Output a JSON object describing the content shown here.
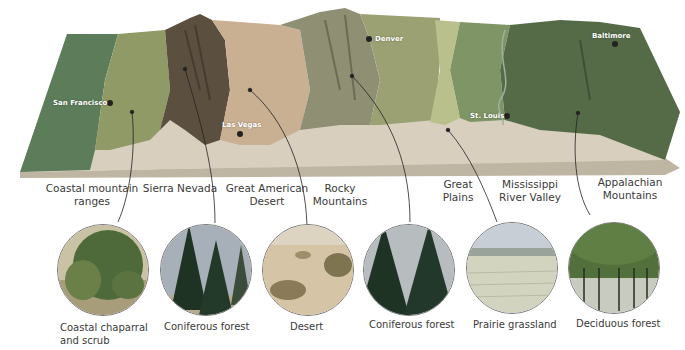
{
  "diagram": {
    "type": "3D cross-section map of biomes across the United States",
    "colors": {
      "coastal_strip": "#5c7c5a",
      "coastal_scrub": "#8f9a66",
      "sierra": "#5b5040",
      "desert": "#c9b092",
      "rockies": "#8f8f73",
      "plains": "#9ba172",
      "prairie_band": "#b9c08c",
      "mississippi": "#7f9565",
      "appalachian": "#556b48",
      "floor": "#d8cfbf"
    },
    "cities": [
      {
        "name": "San Francisco"
      },
      {
        "name": "Las Vegas"
      },
      {
        "name": "Denver"
      },
      {
        "name": "St. Louis"
      },
      {
        "name": "Baltimore"
      }
    ],
    "regions": [
      {
        "line1": "Coastal mountain",
        "line2": "ranges"
      },
      {
        "line1": "Sierra Nevada",
        "line2": ""
      },
      {
        "line1": "Great American",
        "line2": "Desert"
      },
      {
        "line1": "Rocky",
        "line2": "Mountains"
      },
      {
        "line1": "Great",
        "line2": "Plains"
      },
      {
        "line1": "Mississippi",
        "line2": "River Valley"
      },
      {
        "line1": "Appalachian",
        "line2": "Mountains"
      }
    ],
    "biomes": [
      {
        "line1": "Coastal chaparral",
        "line2": "and scrub",
        "icon": "scrub-photo"
      },
      {
        "line1": "Coniferous forest",
        "line2": "",
        "icon": "conifer-photo"
      },
      {
        "line1": "Desert",
        "line2": "",
        "icon": "desert-photo"
      },
      {
        "line1": "Coniferous forest",
        "line2": "",
        "icon": "conifer-photo"
      },
      {
        "line1": "Prairie grassland",
        "line2": "",
        "icon": "grassland-photo"
      },
      {
        "line1": "Deciduous forest",
        "line2": "",
        "icon": "deciduous-photo"
      }
    ]
  }
}
